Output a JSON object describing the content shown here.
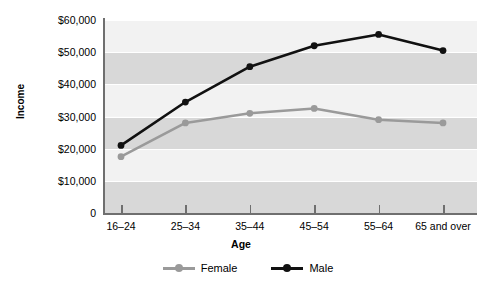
{
  "chart_data": {
    "type": "line",
    "title": "",
    "xlabel": "Age",
    "ylabel": "Income",
    "categories": [
      "16–24",
      "25–34",
      "35–44",
      "45–54",
      "55–64",
      "65 and over"
    ],
    "series": [
      {
        "name": "Female",
        "color": "#9a9a9a",
        "values": [
          17500,
          28000,
          31000,
          32500,
          29000,
          28000
        ]
      },
      {
        "name": "Male",
        "color": "#111111",
        "values": [
          21000,
          34500,
          45500,
          52000,
          55500,
          50500
        ]
      }
    ],
    "ylim": [
      0,
      60000
    ],
    "ytick_values": [
      0,
      10000,
      20000,
      30000,
      40000,
      50000,
      60000
    ],
    "ytick_labels": [
      "0",
      "$10,000",
      "$20,000",
      "$30,000",
      "$40,000",
      "$50,000",
      "$60,000"
    ],
    "grid": true,
    "grid_bands": true,
    "legend_position": "bottom",
    "marker": "circle"
  },
  "axes": {
    "y_title": "Income",
    "x_title": "Age"
  },
  "legend": {
    "items": [
      {
        "label": "Female",
        "color": "#9a9a9a"
      },
      {
        "label": "Male",
        "color": "#111111"
      }
    ]
  },
  "colors": {
    "female": "#9a9a9a",
    "male": "#111111",
    "band_dark": "#d8d8d8",
    "band_light": "#f2f2f2",
    "axis": "#6f6f6f",
    "background": "#ffffff"
  }
}
